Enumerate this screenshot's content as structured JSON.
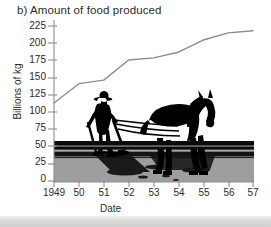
{
  "figure": {
    "panel_label": "b)",
    "title": "b) Amount of food produced",
    "bottom_strip": true
  },
  "chart_data": {
    "type": "line",
    "title": "b) Amount of food produced",
    "xlabel": "Date",
    "ylabel": "Billions of kg",
    "x": [
      1949,
      1950,
      1951,
      1952,
      1953,
      1954,
      1955,
      1956,
      1957
    ],
    "xtick_labels": [
      "1949",
      "50",
      "51",
      "52",
      "53",
      "54",
      "55",
      "56",
      "57"
    ],
    "ytick_labels": [
      "0",
      "25",
      "50",
      "75",
      "100",
      "125",
      "150",
      "175",
      "200",
      "225"
    ],
    "ytick_values": [
      0,
      25,
      50,
      75,
      100,
      125,
      150,
      175,
      200,
      225
    ],
    "values": [
      109,
      136,
      141,
      169,
      172,
      180,
      197,
      207,
      210
    ],
    "xlim": [
      1949,
      1957
    ],
    "ylim": [
      0,
      225
    ],
    "grid": false,
    "legend": null,
    "line_color": "#8c8c8c",
    "line_width": 1.4,
    "background_illustration": "farmer-with-horse-drawn-plough-silhouette",
    "ground_band_color": "#9e9e9e",
    "silhouette_color": "#000000"
  },
  "axis_labels": {
    "y_axis_title": "Billions of kg",
    "x_axis_title": "Date"
  }
}
